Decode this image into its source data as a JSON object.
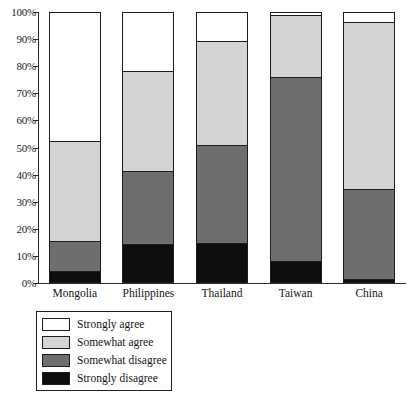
{
  "chart_data": {
    "type": "bar",
    "subtype": "stacked-percentage-column",
    "title": "",
    "xlabel": "",
    "ylabel": "",
    "ylim": [
      0,
      100
    ],
    "grid": false,
    "legend_position": "bottom-left",
    "y_tick_labels": [
      "100%",
      "90%",
      "80%",
      "70%",
      "60%",
      "50%",
      "40%",
      "30%",
      "20%",
      "10%",
      "0%"
    ],
    "y_tick_values": [
      100,
      90,
      80,
      70,
      60,
      50,
      40,
      30,
      20,
      10,
      0
    ],
    "categories": [
      "Mongolia",
      "Philippines",
      "Thailand",
      "Taiwan",
      "China"
    ],
    "series": [
      {
        "name": "Strongly agree",
        "color": "#ffffff",
        "values": [
          47.6,
          21.4,
          10.3,
          0.7,
          3.3
        ]
      },
      {
        "name": "Somewhat agree",
        "color": "#d4d4d4",
        "values": [
          37.3,
          37.3,
          38.7,
          23.2,
          62.0
        ]
      },
      {
        "name": "Somewhat disagree",
        "color": "#6e6e6e",
        "values": [
          11.1,
          27.3,
          36.5,
          68.3,
          33.6
        ]
      },
      {
        "name": "Strongly disagree",
        "color": "#0d0d0d",
        "values": [
          4.0,
          14.0,
          14.5,
          7.8,
          1.1
        ]
      }
    ],
    "stack_boundaries": {
      "Mongolia": [
        52.4,
        15.1,
        4.0
      ],
      "Philippines": [
        78.6,
        41.3,
        14.0
      ],
      "Thailand": [
        89.7,
        51.0,
        14.5
      ],
      "Taiwan": [
        99.3,
        76.1,
        7.8
      ],
      "China": [
        96.7,
        34.7,
        1.1
      ]
    }
  },
  "legend": {
    "items": [
      {
        "label": "Strongly agree",
        "swatch_color": "#ffffff"
      },
      {
        "label": "Somewhat agree",
        "swatch_color": "#d4d4d4"
      },
      {
        "label": "Somewhat disagree",
        "swatch_color": "#6e6e6e"
      },
      {
        "label": "Strongly disagree",
        "swatch_color": "#0d0d0d"
      }
    ]
  }
}
